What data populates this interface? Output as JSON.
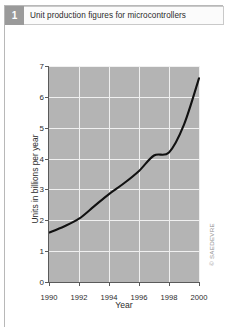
{
  "figure": {
    "number": "1",
    "title": "Unit production figures for microcontrollers",
    "watermark": "© SAEDEVRE"
  },
  "colors": {
    "plot_background": "#b4b4b4",
    "gridline": "#f0f0f0",
    "curve": "#111111",
    "axis": "#5a5a5a",
    "badge": "#9a9a9a",
    "frame": "#b8b8b8"
  },
  "chart_data": {
    "type": "line",
    "title": "Unit production figures for microcontrollers",
    "xlabel": "Year",
    "ylabel": "Units in billions per year",
    "xlim": [
      1990,
      2000
    ],
    "ylim": [
      0,
      7
    ],
    "xticks": [
      1990,
      1992,
      1994,
      1996,
      1998,
      2000
    ],
    "yticks": [
      0,
      1,
      2,
      3,
      4,
      5,
      6,
      7
    ],
    "grid": true,
    "legend": "none",
    "series": [
      {
        "name": "Unit production",
        "x": [
          1990,
          1991,
          1992,
          1993,
          1994,
          1995,
          1996,
          1997,
          1998,
          1999,
          2000
        ],
        "values": [
          1.6,
          1.8,
          2.05,
          2.45,
          2.85,
          3.2,
          3.6,
          4.1,
          4.2,
          5.1,
          6.6
        ]
      }
    ]
  }
}
